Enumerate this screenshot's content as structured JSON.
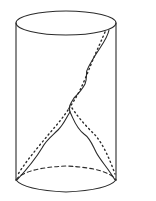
{
  "figure": {
    "stroke_color": "#2a2a2a",
    "background": "#ffffff",
    "cylinder": {
      "left_x": 16,
      "right_x": 116,
      "top_center_y": 23,
      "top_ry": 12,
      "bottom_center_y": 180,
      "bottom_ry": 12
    }
  }
}
